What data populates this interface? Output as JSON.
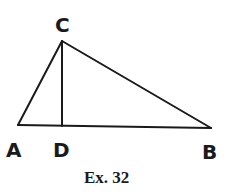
{
  "figure": {
    "caption": "Ex. 32",
    "points": [
      {
        "id": "A",
        "label": "A"
      },
      {
        "id": "B",
        "label": "B"
      },
      {
        "id": "C",
        "label": "C"
      },
      {
        "id": "D",
        "label": "D"
      }
    ],
    "segments": [
      {
        "from": "A",
        "to": "C"
      },
      {
        "from": "C",
        "to": "B"
      },
      {
        "from": "A",
        "to": "B"
      },
      {
        "from": "C",
        "to": "D"
      }
    ],
    "relations": [
      "D lies on AB",
      "CD is the altitude from C to AB"
    ]
  }
}
